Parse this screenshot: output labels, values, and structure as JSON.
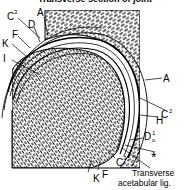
{
  "figure": {
    "title": "Transverse section of joint",
    "colors": {
      "ink": "#000000",
      "paper": "#ffffff"
    },
    "labels": {
      "C3_top": "C",
      "C3_top_sup": "3",
      "A_top": "A",
      "D_top": "D",
      "F_left": "F",
      "K_left": "K",
      "I_left": "I",
      "A_right": "A",
      "C2_right": "C",
      "C2_right_sup": "2",
      "H_right": "H",
      "D_right": "D",
      "D_right_sup": "1",
      "D_right_sub": "o",
      "star": "*",
      "C3_bottom": "C",
      "C3_bottom_sup": "3",
      "F_bottom": "F",
      "K_bottom": "K"
    },
    "caption_line1": "Transverse",
    "caption_line2": "acetabular lig."
  }
}
